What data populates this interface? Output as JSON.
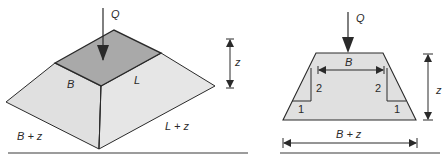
{
  "figure": {
    "left": {
      "title": "pyramid-frustum-3d",
      "load_label": "Q",
      "top_width_label": "B",
      "top_length_label": "L",
      "base_width_label": "B + z",
      "base_length_label": "L + z",
      "depth_label": "z"
    },
    "right": {
      "title": "trapezoid-section",
      "load_label": "Q",
      "top_width_label": "B",
      "base_width_label": "B + z",
      "depth_label": "z",
      "slope_vertical_left": "2",
      "slope_vertical_right": "2",
      "slope_horizontal_left": "1",
      "slope_horizontal_right": "1"
    },
    "colors": {
      "top_face": "#a9a9a9",
      "side_face": "#e4e4e4",
      "front_face": "#dcdcdc",
      "line": "#2a2a2a"
    }
  }
}
